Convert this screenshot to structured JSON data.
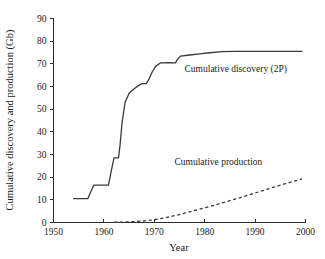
{
  "chart_data": {
    "type": "line",
    "title": "",
    "xlabel": "Year",
    "ylabel": "Cumulative discovery and production (Gb)",
    "xlim": [
      1950,
      2000
    ],
    "ylim": [
      0,
      90
    ],
    "xticks": [
      1950,
      1960,
      1970,
      1980,
      1990,
      2000
    ],
    "yticks": [
      0,
      10,
      20,
      30,
      40,
      50,
      60,
      70,
      80,
      90
    ],
    "grid": false,
    "legend_position": "inline-annotation",
    "series": [
      {
        "name": "Cumulative discovery (2P)",
        "style": "solid",
        "x": [
          1954.0,
          1956.8,
          1957.4,
          1958.0,
          1960.9,
          1961.4,
          1962.0,
          1962.9,
          1963.2,
          1963.6,
          1964.2,
          1965.0,
          1966.0,
          1967.0,
          1967.6,
          1968.4,
          1969.0,
          1969.6,
          1970.3,
          1971.2,
          1973.0,
          1974.2,
          1974.6,
          1975.2,
          1977.0,
          1979.0,
          1981.0,
          1983.5,
          1986.0,
          1990.0,
          1995.0,
          1999.3
        ],
        "y": [
          10.5,
          10.5,
          13.6,
          16.5,
          16.5,
          22.0,
          28.5,
          28.5,
          34.0,
          44.0,
          53.0,
          57.0,
          59.0,
          60.6,
          61.3,
          61.3,
          63.5,
          66.5,
          69.0,
          70.4,
          70.5,
          70.4,
          72.0,
          73.4,
          73.9,
          74.4,
          74.9,
          75.4,
          75.5,
          75.5,
          75.5,
          75.5
        ]
      },
      {
        "name": "Cumulative production",
        "style": "dashed",
        "x": [
          1962.0,
          1964.0,
          1966.0,
          1968.0,
          1970.0,
          1972.0,
          1974.0,
          1976.0,
          1978.0,
          1980.0,
          1982.0,
          1984.0,
          1986.0,
          1988.0,
          1990.0,
          1992.0,
          1994.0,
          1996.0,
          1998.0,
          1999.3
        ],
        "y": [
          0.1,
          0.2,
          0.4,
          0.7,
          1.2,
          2.0,
          3.0,
          4.1,
          5.3,
          6.5,
          7.7,
          9.0,
          10.3,
          11.6,
          13.0,
          14.4,
          15.8,
          17.1,
          18.4,
          19.2
        ]
      }
    ],
    "annotations": [
      {
        "text": "Cumulative discovery (2P)",
        "x": 1976.0,
        "y": 66.5
      },
      {
        "text": "Cumulative production",
        "x": 1974.0,
        "y": 25.5
      }
    ]
  },
  "axes": {
    "x_title": "Year",
    "y_title": "Cumulative discovery and production (Gb)"
  }
}
